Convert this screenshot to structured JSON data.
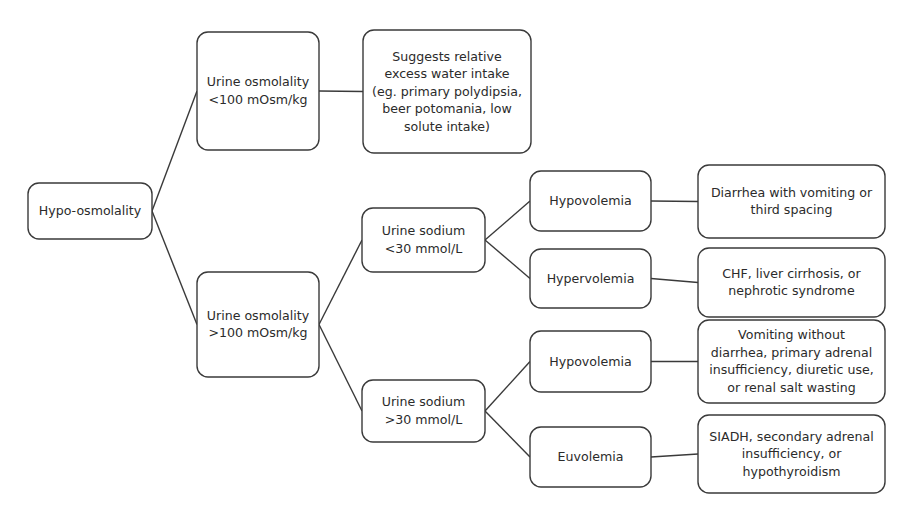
{
  "diagram": {
    "type": "flowchart",
    "background_color": "#ffffff",
    "stroke_color": "#3a3a3a",
    "text_color": "#2b2b2b"
  },
  "nodes": {
    "root": {
      "id": "root",
      "lines": [
        "Hypo-osmolality"
      ],
      "x": 28,
      "y": 183,
      "w": 124,
      "h": 56
    },
    "urine_osm_low": {
      "id": "urine-osmolality-low",
      "lines": [
        "Urine osmolality",
        "<100 mOsm/kg"
      ],
      "x": 197,
      "y": 32,
      "w": 122,
      "h": 118
    },
    "excess_water": {
      "id": "suggests-excess-water-intake",
      "lines": [
        "Suggests relative",
        "excess water intake",
        "(eg. primary polydipsia,",
        "beer potomania, low",
        "solute intake)"
      ],
      "x": 363,
      "y": 30,
      "w": 168,
      "h": 123
    },
    "urine_osm_high": {
      "id": "urine-osmolality-high",
      "lines": [
        "Urine osmolality",
        ">100 mOsm/kg"
      ],
      "x": 197,
      "y": 272,
      "w": 122,
      "h": 105
    },
    "urine_na_low": {
      "id": "urine-sodium-low",
      "lines": [
        "Urine sodium",
        "<30 mmol/L"
      ],
      "x": 362,
      "y": 208,
      "w": 123,
      "h": 64
    },
    "urine_na_high": {
      "id": "urine-sodium-high",
      "lines": [
        "Urine sodium",
        ">30 mmol/L"
      ],
      "x": 362,
      "y": 380,
      "w": 123,
      "h": 62
    },
    "hypovolemia_a": {
      "id": "hypovolemia-low-sodium",
      "lines": [
        "Hypovolemia"
      ],
      "x": 530,
      "y": 171,
      "w": 121,
      "h": 60
    },
    "hypervolemia": {
      "id": "hypervolemia",
      "lines": [
        "Hypervolemia"
      ],
      "x": 530,
      "y": 249,
      "w": 121,
      "h": 59
    },
    "hypovolemia_b": {
      "id": "hypovolemia-high-sodium",
      "lines": [
        "Hypovolemia"
      ],
      "x": 530,
      "y": 331,
      "w": 121,
      "h": 61
    },
    "euvolemia": {
      "id": "euvolemia",
      "lines": [
        "Euvolemia"
      ],
      "x": 530,
      "y": 427,
      "w": 121,
      "h": 60
    },
    "diarrhea": {
      "id": "diarrhea-vomiting-third-spacing",
      "lines": [
        "Diarrhea with vomiting or",
        "third spacing"
      ],
      "x": 698,
      "y": 165,
      "w": 187,
      "h": 73
    },
    "chf": {
      "id": "chf-cirrhosis-nephrotic",
      "lines": [
        "CHF, liver cirrhosis, or",
        "nephrotic syndrome"
      ],
      "x": 698,
      "y": 248,
      "w": 187,
      "h": 69
    },
    "vomiting": {
      "id": "vomiting-adrenal-diuretic-salt-wasting",
      "lines": [
        "Vomiting without",
        "diarrhea, primary adrenal",
        "insufficiency, diuretic use,",
        "or renal salt wasting"
      ],
      "x": 698,
      "y": 320,
      "w": 187,
      "h": 83
    },
    "siadh": {
      "id": "siadh-adrenal-hypothyroidism",
      "lines": [
        "SIADH, secondary adrenal",
        "insufficiency, or",
        "hypothyroidism"
      ],
      "x": 698,
      "y": 415,
      "w": 187,
      "h": 78
    }
  },
  "edges": [
    {
      "id": "root-to-urine-osm-low",
      "from": "root",
      "to": "urine_osm_low",
      "kind": "diagonal"
    },
    {
      "id": "root-to-urine-osm-high",
      "from": "root",
      "to": "urine_osm_high",
      "kind": "diagonal"
    },
    {
      "id": "urine-osm-low-to-excess-water",
      "from": "urine_osm_low",
      "to": "excess_water",
      "kind": "horizontal"
    },
    {
      "id": "urine-osm-high-to-sodium-low",
      "from": "urine_osm_high",
      "to": "urine_na_low",
      "kind": "diagonal"
    },
    {
      "id": "urine-osm-high-to-sodium-high",
      "from": "urine_osm_high",
      "to": "urine_na_high",
      "kind": "diagonal"
    },
    {
      "id": "sodium-low-to-hypovolemia",
      "from": "urine_na_low",
      "to": "hypovolemia_a",
      "kind": "diagonal"
    },
    {
      "id": "sodium-low-to-hypervolemia",
      "from": "urine_na_low",
      "to": "hypervolemia",
      "kind": "diagonal"
    },
    {
      "id": "sodium-high-to-hypovolemia",
      "from": "urine_na_high",
      "to": "hypovolemia_b",
      "kind": "diagonal"
    },
    {
      "id": "sodium-high-to-euvolemia",
      "from": "urine_na_high",
      "to": "euvolemia",
      "kind": "diagonal"
    },
    {
      "id": "hypovolemia-to-diarrhea",
      "from": "hypovolemia_a",
      "to": "diarrhea",
      "kind": "horizontal"
    },
    {
      "id": "hypervolemia-to-chf",
      "from": "hypervolemia",
      "to": "chf",
      "kind": "horizontal"
    },
    {
      "id": "hypovolemia-b-to-vomiting",
      "from": "hypovolemia_b",
      "to": "vomiting",
      "kind": "horizontal"
    },
    {
      "id": "euvolemia-to-siadh",
      "from": "euvolemia",
      "to": "siadh",
      "kind": "horizontal"
    }
  ]
}
